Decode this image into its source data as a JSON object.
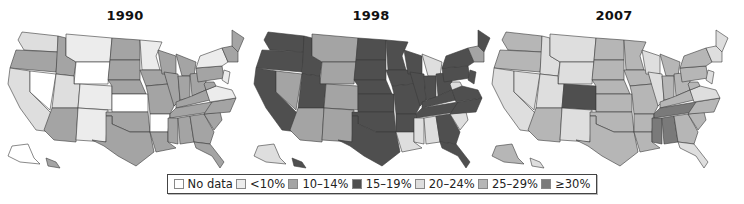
{
  "maps": [
    {
      "title": "1990",
      "states": {
        "WA": "c20",
        "OR": "c10",
        "CA": "c20",
        "NV": "nd",
        "ID": "c10",
        "MT": "lt10",
        "WY": "nd",
        "UT": "c20",
        "CO": "lt10",
        "AZ": "c10",
        "NM": "lt10",
        "ND": "c10",
        "SD": "c10",
        "NE": "c10",
        "KS": "nd",
        "OK": "c10",
        "TX": "c10",
        "MN": "lt10",
        "IA": "c10",
        "MO": "c10",
        "AR": "nd",
        "LA": "c10",
        "WI": "c10",
        "IL": "c10",
        "MI": "c10",
        "IN": "c10",
        "OH": "c10",
        "KY": "c10",
        "TN": "c10",
        "MS": "c10",
        "AL": "c10",
        "GA": "c10",
        "FL": "c10",
        "SC": "c10",
        "NC": "c10",
        "VA": "lt10",
        "WV": "c10",
        "PA": "c10",
        "NY": "lt10",
        "ME": "c10",
        "NE_ENG": "c10",
        "NJ": "lt10",
        "AK": "nd",
        "HI": "c10"
      }
    },
    {
      "title": "1998",
      "states": {
        "WA": "c15",
        "OR": "c15",
        "CA": "c15",
        "NV": "c10",
        "ID": "c15",
        "MT": "c10",
        "WY": "c10",
        "UT": "c15",
        "CO": "c10",
        "AZ": "c10",
        "NM": "c10",
        "ND": "c15",
        "SD": "c15",
        "NE": "c15",
        "KS": "c15",
        "OK": "c15",
        "TX": "c15",
        "MN": "c15",
        "IA": "c15",
        "MO": "c15",
        "AR": "c15",
        "LA": "c20",
        "WI": "c15",
        "IL": "c15",
        "MI": "c20",
        "IN": "c15",
        "OH": "c15",
        "KY": "c15",
        "TN": "c15",
        "MS": "c20",
        "AL": "c20",
        "GA": "c15",
        "FL": "c15",
        "SC": "c20",
        "NC": "c15",
        "VA": "c15",
        "WV": "c20",
        "PA": "c15",
        "NY": "c15",
        "ME": "c15",
        "NE_ENG": "c10",
        "NJ": "c15",
        "AK": "c20",
        "HI": "c15"
      }
    },
    {
      "title": "2007",
      "states": {
        "WA": "c25",
        "OR": "c25",
        "CA": "c20",
        "NV": "c20",
        "ID": "c20",
        "MT": "c20",
        "WY": "c20",
        "UT": "c20",
        "CO": "c15",
        "AZ": "c25",
        "NM": "c20",
        "ND": "c25",
        "SD": "c25",
        "NE": "c25",
        "KS": "c25",
        "OK": "c25",
        "TX": "c25",
        "MN": "c25",
        "IA": "c25",
        "MO": "c25",
        "AR": "c25",
        "LA": "c25",
        "WI": "c20",
        "IL": "c20",
        "MI": "c25",
        "IN": "c25",
        "OH": "c25",
        "KY": "c25",
        "TN": "c30",
        "MS": "c30",
        "AL": "c30",
        "GA": "c25",
        "FL": "c20",
        "SC": "c25",
        "NC": "c25",
        "VA": "c20",
        "WV": "c25",
        "PA": "c25",
        "NY": "c25",
        "ME": "c20",
        "NE_ENG": "c20",
        "NJ": "c20",
        "AK": "c25",
        "HI": "c20"
      }
    }
  ],
  "legend": {
    "items": [
      {
        "key": "nd",
        "label": "No data",
        "color": "#ffffff"
      },
      {
        "key": "lt10",
        "label": "<10%",
        "color": "#ececec"
      },
      {
        "key": "c10",
        "label": "10–14%",
        "color": "#a4a4a4"
      },
      {
        "key": "c15",
        "label": "15–19%",
        "color": "#4f4f4f"
      },
      {
        "key": "c20",
        "label": "20–24%",
        "color": "#dedede"
      },
      {
        "key": "c25",
        "label": "25–29%",
        "color": "#b6b6b6"
      },
      {
        "key": "c30",
        "label": "≥30%",
        "color": "#7a7a7a"
      }
    ]
  }
}
